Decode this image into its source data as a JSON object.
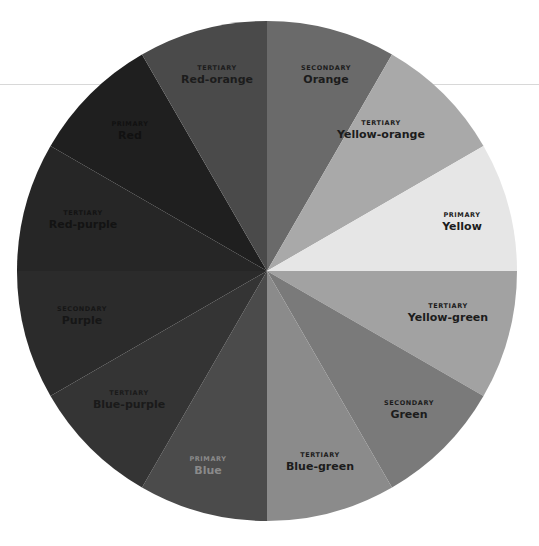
{
  "wheel": {
    "cx": 267,
    "cy": 271,
    "r": 250,
    "start_angle_deg": 0,
    "direction": "clockwise from 12 o'clock",
    "slices": [
      {
        "category": "SECONDARY",
        "name": "Orange",
        "color": "#6a6a6a",
        "text": "#1c1c1c",
        "lx": 326,
        "ly": 64
      },
      {
        "category": "TERTIARY",
        "name": "Yellow-orange",
        "color": "#a9a9a9",
        "text": "#1c1c1c",
        "lx": 381,
        "ly": 119
      },
      {
        "category": "PRIMARY",
        "name": "Yellow",
        "color": "#e6e6e6",
        "text": "#1c1c1c",
        "lx": 462,
        "ly": 211
      },
      {
        "category": "TERTIARY",
        "name": "Yellow-green",
        "color": "#a2a2a2",
        "text": "#1c1c1c",
        "lx": 448,
        "ly": 302
      },
      {
        "category": "SECONDARY",
        "name": "Green",
        "color": "#7a7a7a",
        "text": "#1c1c1c",
        "lx": 409,
        "ly": 399
      },
      {
        "category": "TERTIARY",
        "name": "Blue-green",
        "color": "#8b8b8b",
        "text": "#1c1c1c",
        "lx": 320,
        "ly": 451
      },
      {
        "category": "PRIMARY",
        "name": "Blue",
        "color": "#4b4b4b",
        "text": "#8a8a8a",
        "lx": 208,
        "ly": 455
      },
      {
        "category": "TERTIARY",
        "name": "Blue-purple",
        "color": "#343434",
        "text": "#1a1a1a",
        "lx": 129,
        "ly": 389
      },
      {
        "category": "SECONDARY",
        "name": "Purple",
        "color": "#2b2b2b",
        "text": "#161616",
        "lx": 82,
        "ly": 305
      },
      {
        "category": "TERTIARY",
        "name": "Red-purple",
        "color": "#262626",
        "text": "#131313",
        "lx": 83,
        "ly": 209
      },
      {
        "category": "PRIMARY",
        "name": "Red",
        "color": "#1f1f1f",
        "text": "#111111",
        "lx": 130,
        "ly": 120
      },
      {
        "category": "TERTIARY",
        "name": "Red-orange",
        "color": "#4a4a4a",
        "text": "#1c1c1c",
        "lx": 217,
        "ly": 64
      }
    ]
  }
}
